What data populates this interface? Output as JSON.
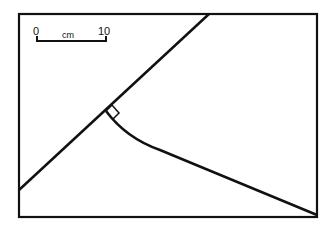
{
  "diagram": {
    "scale_bar": {
      "start_label": "0",
      "unit_label": "cm",
      "end_label": "10"
    },
    "elements": [
      "rectangular frame",
      "straight diagonal line",
      "curved line perpendicular to diagonal (right-angle marker)",
      "scale bar"
    ],
    "colors": {
      "line": "#111111",
      "background": "#ffffff"
    }
  }
}
